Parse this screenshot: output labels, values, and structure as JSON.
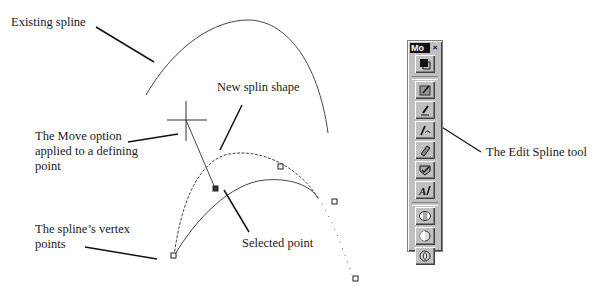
{
  "labels": {
    "existing_spline": "Existing spline",
    "new_spline_shape": "New splin shape",
    "move_option_line1": "The Move option",
    "move_option_line2": "applied to a defining",
    "move_option_line3": "point",
    "vertex_points_line1": "The spline’s vertex",
    "vertex_points_line2": "points",
    "selected_point": "Selected point",
    "edit_spline_tool": "The Edit Spline tool"
  },
  "toolbar": {
    "title": "Mo",
    "close_glyph": "×",
    "buttons": [
      {
        "name": "select-tool",
        "icon": "select-icon"
      },
      {
        "name": "reshape-tool",
        "icon": "reshape-icon"
      },
      {
        "name": "pen-tool",
        "icon": "pen-icon"
      },
      {
        "name": "edit-spline-tool",
        "icon": "edit-spline-icon"
      },
      {
        "name": "eraser-tool",
        "icon": "eraser-icon"
      },
      {
        "name": "check-tool",
        "icon": "check-icon"
      },
      {
        "name": "text-tool",
        "icon": "text-icon"
      },
      {
        "name": "boolean-union-tool",
        "icon": "union-icon"
      },
      {
        "name": "boolean-subtract-tool",
        "icon": "subtract-icon"
      },
      {
        "name": "boolean-intersect-tool",
        "icon": "intersect-icon"
      }
    ]
  },
  "colors": {
    "line": "#222222",
    "toolbar_bg": "#c0c0c0",
    "title_bg": "#111111"
  }
}
